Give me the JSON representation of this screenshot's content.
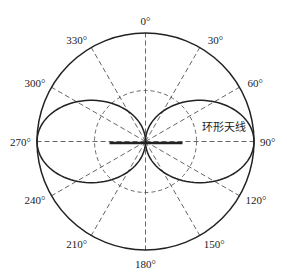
{
  "diagram": {
    "type": "polar-radiation-pattern",
    "pattern_label": "环形天线",
    "angle_labels": [
      {
        "angle": 0,
        "text": "0°"
      },
      {
        "angle": 30,
        "text": "30°"
      },
      {
        "angle": 60,
        "text": "60°"
      },
      {
        "angle": 90,
        "text": "90°"
      },
      {
        "angle": 120,
        "text": "120°"
      },
      {
        "angle": 150,
        "text": "150°"
      },
      {
        "angle": 180,
        "text": "180°"
      },
      {
        "angle": 210,
        "text": "210°"
      },
      {
        "angle": 240,
        "text": "240°"
      },
      {
        "angle": 270,
        "text": "270°"
      },
      {
        "angle": 300,
        "text": "300°"
      },
      {
        "angle": 330,
        "text": "330°"
      }
    ],
    "rings": [
      {
        "level": 1.0,
        "style": "solid"
      },
      {
        "level": 0.5,
        "style": "dashed"
      }
    ],
    "pattern": {
      "shape": "figure-eight",
      "lobe_directions_deg": [
        90,
        270
      ],
      "nulls_deg": [
        0,
        180
      ],
      "max_level": 1.0
    },
    "antenna_element": "horizontal bar along 90°–270° axis"
  },
  "colors": {
    "line": "#222222",
    "dash": "#555555",
    "background": "#ffffff"
  }
}
